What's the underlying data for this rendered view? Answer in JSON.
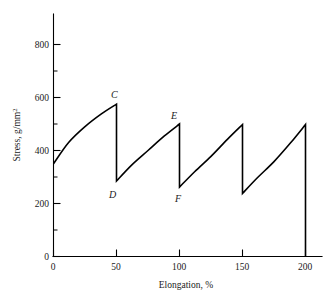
{
  "chart_data": {
    "type": "line",
    "title": "",
    "xlabel": "Elongation, %",
    "ylabel": "Stress, g/mm",
    "ylabel_superscript": "2",
    "ylabel_full": "Stress, g/mm2",
    "xlim": [
      0,
      215
    ],
    "ylim": [
      0,
      900
    ],
    "xticks": [
      0,
      50,
      100,
      150,
      200
    ],
    "xticklabels": [
      "0",
      "50",
      "100",
      "150",
      "200"
    ],
    "yticks": [
      0,
      200,
      400,
      600,
      800
    ],
    "yticklabels": [
      "0",
      "200",
      "400",
      "600",
      "800"
    ],
    "x_minor_ticks": [
      25,
      75,
      125,
      175
    ],
    "y_minor_ticks": [
      100,
      300,
      500,
      700
    ],
    "grid": false,
    "legend": null,
    "series": [
      {
        "name": "stress-elongation",
        "points": [
          {
            "x": 0,
            "y": 350,
            "label": null,
            "kind": "start"
          },
          {
            "x": 12,
            "y": 430,
            "label": null,
            "kind": "curve"
          },
          {
            "x": 25,
            "y": 490,
            "label": null,
            "kind": "curve"
          },
          {
            "x": 38,
            "y": 538,
            "label": null,
            "kind": "curve"
          },
          {
            "x": 50,
            "y": 575,
            "label": "C",
            "kind": "peak"
          },
          {
            "x": 50,
            "y": 285,
            "label": "D",
            "kind": "valley"
          },
          {
            "x": 62,
            "y": 345,
            "label": null,
            "kind": "curve"
          },
          {
            "x": 75,
            "y": 400,
            "label": null,
            "kind": "curve"
          },
          {
            "x": 88,
            "y": 455,
            "label": null,
            "kind": "curve"
          },
          {
            "x": 100,
            "y": 500,
            "label": "E",
            "kind": "peak"
          },
          {
            "x": 100,
            "y": 262,
            "label": "F",
            "kind": "valley"
          },
          {
            "x": 112,
            "y": 320,
            "label": null,
            "kind": "curve"
          },
          {
            "x": 125,
            "y": 378,
            "label": null,
            "kind": "curve"
          },
          {
            "x": 138,
            "y": 442,
            "label": null,
            "kind": "curve"
          },
          {
            "x": 150,
            "y": 498,
            "label": null,
            "kind": "peak"
          },
          {
            "x": 150,
            "y": 238,
            "label": null,
            "kind": "valley"
          },
          {
            "x": 162,
            "y": 298,
            "label": null,
            "kind": "curve"
          },
          {
            "x": 175,
            "y": 358,
            "label": null,
            "kind": "curve"
          },
          {
            "x": 188,
            "y": 428,
            "label": null,
            "kind": "curve"
          },
          {
            "x": 200,
            "y": 498,
            "label": null,
            "kind": "peak"
          },
          {
            "x": 200,
            "y": 0,
            "label": null,
            "kind": "end"
          }
        ]
      }
    ],
    "annotations": [
      {
        "label": "C",
        "x": 50,
        "y": 575,
        "meaning": "first-cycle peak stress"
      },
      {
        "label": "D",
        "x": 50,
        "y": 285,
        "meaning": "first-cycle unloaded stress"
      },
      {
        "label": "E",
        "x": 100,
        "y": 500,
        "meaning": "second-cycle peak stress"
      },
      {
        "label": "F",
        "x": 100,
        "y": 262,
        "meaning": "second-cycle unloaded stress"
      }
    ],
    "colors": {
      "curve": "#000000",
      "axis": "#000000",
      "text": "#1a1a1a",
      "background": "#ffffff"
    }
  }
}
